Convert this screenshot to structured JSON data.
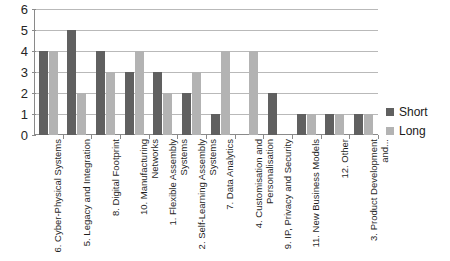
{
  "chart_data": {
    "type": "bar",
    "title": "",
    "xlabel": "",
    "ylabel": "",
    "ylim": [
      0,
      6
    ],
    "yticks": [
      0,
      1,
      2,
      3,
      4,
      5,
      6
    ],
    "grid": true,
    "legend_position": "right",
    "categories": [
      "6. Cyber-Physical Systems",
      "5. Legacy and Integration",
      "8. Digital Footprint",
      "10. Manufacturing Networks",
      "1. Flexible Assembly Systems",
      "2. Self-Learning Assembly Systems",
      "7. Data Analytics",
      "4. Customisation and Personalisation",
      "9. IP, Privacy and Security",
      "11. New Business Models",
      "12. Other",
      "3. Product Development and..."
    ],
    "series": [
      {
        "name": "Short",
        "color": "#606060",
        "values": [
          4,
          5,
          4,
          3,
          3,
          2,
          1,
          0,
          2,
          1,
          1,
          1
        ]
      },
      {
        "name": "Long",
        "color": "#b3b3b3",
        "values": [
          4,
          2,
          3,
          4,
          2,
          3,
          4,
          4,
          0,
          1,
          1,
          1
        ]
      }
    ]
  },
  "legend": {
    "items": [
      {
        "label": "Short",
        "swatch": "short"
      },
      {
        "label": "Long",
        "swatch": "long"
      }
    ]
  }
}
